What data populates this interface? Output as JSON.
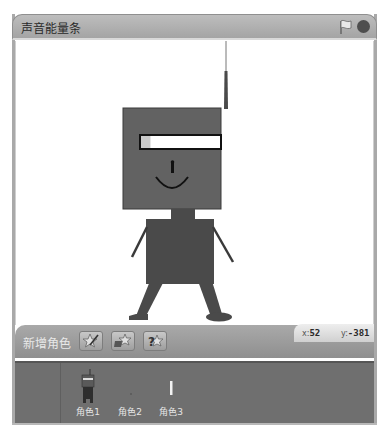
{
  "window": {
    "title": "声音能量条",
    "icons": {
      "start": "green-flag-icon",
      "stop": "stop-sign-icon"
    }
  },
  "stage": {
    "background": "#ffffff",
    "robot": {
      "body_color": "#4a4a4a",
      "head_color": "#626262",
      "energy_bar": {
        "level_fraction": 0.12,
        "fill_color": "#c9c9c9",
        "empty_color": "#ffffff"
      }
    }
  },
  "toolbar": {
    "label": "新增角色",
    "buttons": [
      {
        "name": "paint-new-sprite",
        "icon": "paintbrush-star-icon"
      },
      {
        "name": "choose-sprite-from-file",
        "icon": "folder-star-icon"
      },
      {
        "name": "random-sprite",
        "icon": "question-star-icon"
      }
    ]
  },
  "coords": {
    "x_label": "x:",
    "x_value": "52",
    "y_label": "y:",
    "y_value": "-381"
  },
  "sprites": [
    {
      "name": "角色1",
      "thumb": "robot-thumb"
    },
    {
      "name": "角色2",
      "thumb": "empty-thumb"
    },
    {
      "name": "角色3",
      "thumb": "bar-thumb"
    }
  ]
}
